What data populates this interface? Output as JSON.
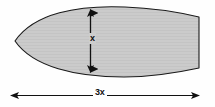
{
  "diagram": {
    "shape": {
      "name": "lens-shape",
      "fill_color": "#cbcbcb",
      "stroke_color": "#1a1a1a",
      "description": "pointed-left lens / leaf shape clipped at right edge"
    },
    "background_color": "#fefefe",
    "dimensions": [
      {
        "id": "height",
        "label": "x",
        "orientation": "vertical",
        "arrow_style": "double-headed",
        "icon": "double-arrow-vertical-icon"
      },
      {
        "id": "width",
        "label": "3x",
        "orientation": "horizontal",
        "arrow_style": "double-headed",
        "icon": "double-arrow-horizontal-icon"
      }
    ]
  }
}
